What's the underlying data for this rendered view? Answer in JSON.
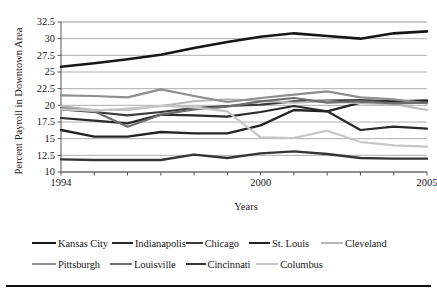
{
  "chart_data": {
    "type": "line",
    "title": "",
    "xlabel": "Years",
    "ylabel": "Percent Payroll in Downtown Area",
    "x": [
      1994,
      1995,
      1996,
      1997,
      1998,
      1999,
      2000,
      2001,
      2002,
      2003,
      2004,
      2005
    ],
    "xtick_labels": [
      "1994",
      "2000",
      "2005"
    ],
    "xtick_values": [
      1994,
      2000,
      2005
    ],
    "ytick_labels": [
      "10",
      "12.5",
      "15",
      "17.5",
      "20",
      "22.5",
      "25",
      "27.5",
      "30",
      "32.5"
    ],
    "ytick_values": [
      10,
      12.5,
      15,
      17.5,
      20,
      22.5,
      25,
      27.5,
      30,
      32.5
    ],
    "xlim": [
      1994,
      2005
    ],
    "ylim": [
      10,
      32.5
    ],
    "grid": "horizontal",
    "legend_position": "below",
    "series": [
      {
        "name": "Kansas City",
        "color": "#161616",
        "width": 2.6,
        "values": [
          25.8,
          26.3,
          26.9,
          27.6,
          28.6,
          29.5,
          30.3,
          30.8,
          30.4,
          30.0,
          30.8,
          31.1
        ]
      },
      {
        "name": "Indianapolis",
        "color": "#2a2a2a",
        "width": 2.2,
        "values": [
          18.1,
          17.7,
          17.3,
          18.6,
          18.5,
          18.3,
          19.0,
          19.9,
          19.1,
          16.3,
          16.8,
          16.5
        ]
      },
      {
        "name": "Chicago",
        "color": "#3b3b3b",
        "width": 2.2,
        "values": [
          19.4,
          19.0,
          18.5,
          19.0,
          19.6,
          19.9,
          20.1,
          20.6,
          20.7,
          20.8,
          20.6,
          20.7
        ]
      },
      {
        "name": "St. Louis",
        "color": "#242424",
        "width": 2.4,
        "values": [
          16.3,
          15.3,
          15.3,
          16.0,
          15.8,
          15.8,
          17.0,
          19.3,
          19.1,
          20.4,
          20.6,
          20.7
        ]
      },
      {
        "name": "Cleveland",
        "color": "#b9b9b9",
        "width": 2.0,
        "values": [
          19.9,
          19.3,
          19.3,
          19.9,
          20.6,
          20.9,
          20.7,
          20.4,
          20.6,
          20.3,
          20.2,
          19.3
        ]
      },
      {
        "name": "Pittsburgh",
        "color": "#8e8e8e",
        "width": 2.2,
        "values": [
          21.5,
          21.4,
          21.2,
          22.4,
          21.4,
          20.5,
          21.1,
          21.6,
          22.1,
          21.2,
          20.9,
          20.3
        ]
      },
      {
        "name": "Louisville",
        "color": "#6e6e6e",
        "width": 2.2,
        "values": [
          19.6,
          19.1,
          16.8,
          18.6,
          19.4,
          19.8,
          20.6,
          21.1,
          20.4,
          20.6,
          20.3,
          20.4
        ]
      },
      {
        "name": "Cincinnati",
        "color": "#343434",
        "width": 2.4,
        "values": [
          11.9,
          11.8,
          11.8,
          11.8,
          12.6,
          12.1,
          12.8,
          13.1,
          12.7,
          12.1,
          12.0,
          12.0
        ]
      },
      {
        "name": "Columbus",
        "color": "#c6c6c6",
        "width": 2.2,
        "values": [
          19.4,
          19.2,
          19.5,
          19.9,
          19.7,
          19.1,
          15.2,
          15.1,
          16.2,
          14.5,
          14.0,
          13.8
        ]
      }
    ]
  },
  "legend": {
    "rows": [
      [
        {
          "label": "Kansas City",
          "color": "#161616",
          "width": 2.6,
          "swatch": 24,
          "gap": 0
        },
        {
          "label": "Indianapolis",
          "color": "#2a2a2a",
          "width": 2.4,
          "swatch": 21,
          "gap": 4
        },
        {
          "label": "Chicago",
          "color": "#3b3b3b",
          "width": 2.2,
          "swatch": 17,
          "gap": 0
        },
        {
          "label": "St. Louis",
          "color": "#242424",
          "width": 2.4,
          "swatch": 21,
          "gap": 10
        },
        {
          "label": "Cleveland",
          "color": "#b9b9b9",
          "width": 2.0,
          "swatch": 22,
          "gap": 12
        }
      ],
      [
        {
          "label": "Pittsburgh",
          "color": "#8e8e8e",
          "width": 2.2,
          "swatch": 24,
          "gap": 0
        },
        {
          "label": "Louisville",
          "color": "#6e6e6e",
          "width": 2.2,
          "swatch": 22,
          "gap": 10
        },
        {
          "label": "Cincinnati",
          "color": "#343434",
          "width": 2.4,
          "swatch": 20,
          "gap": 10
        },
        {
          "label": "Columbus",
          "color": "#c6c6c6",
          "width": 2.2,
          "swatch": 22,
          "gap": 6
        }
      ]
    ]
  }
}
